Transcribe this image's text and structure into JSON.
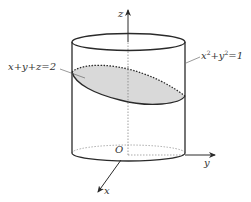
{
  "figure": {
    "type": "3d-cylinder-plane-intersection",
    "colors": {
      "stroke": "#2a2a2a",
      "dashed": "#555555",
      "fill": "#d9d9d9",
      "background": "#ffffff"
    },
    "axes": {
      "x_label": "x",
      "y_label": "y",
      "z_label": "z",
      "origin_label": "O"
    },
    "surfaces": {
      "plane_label": "x+y+z=2",
      "cylinder_label_base": "x",
      "cylinder_label_mid": "+y",
      "cylinder_label_end": "=1",
      "cylinder_exponent": "2"
    }
  }
}
